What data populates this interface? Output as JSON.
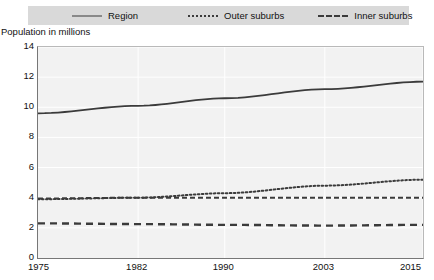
{
  "chart_data": {
    "type": "line",
    "title": "",
    "ylabel": "Population in millions",
    "xlabel": "",
    "ylim": [
      0,
      14
    ],
    "ytick_labels": [
      "0",
      "2",
      "4",
      "6",
      "8",
      "10",
      "12",
      "14"
    ],
    "ytick_values": [
      0,
      2,
      4,
      6,
      8,
      10,
      12,
      14
    ],
    "x": [
      1975,
      1982,
      1990,
      2003,
      2015
    ],
    "xtick_labels": [
      "1975",
      "1982",
      "1990",
      "2003",
      "2015"
    ],
    "grid": "horizontal-and-vertical-white",
    "legend_position": "top",
    "series": [
      {
        "name": "Region",
        "style": "solid",
        "color": "#3b3b3b",
        "values": [
          9.6,
          10.1,
          10.6,
          11.2,
          11.7
        ]
      },
      {
        "name": "Outer suburbs",
        "style": "dotted",
        "color": "#3b3b3b",
        "values": [
          3.9,
          4.0,
          4.3,
          4.8,
          5.2
        ]
      },
      {
        "name": "Inner suburbs",
        "style": "dash-dot",
        "color": "#3b3b3b",
        "values": [
          3.95,
          4.0,
          4.0,
          4.0,
          4.0
        ]
      },
      {
        "name": "Paris",
        "style": "dashed",
        "color": "#3b3b3b",
        "values": [
          2.3,
          2.25,
          2.2,
          2.15,
          2.2
        ]
      }
    ]
  },
  "legend": {
    "items": [
      {
        "label": "Region",
        "style": "solid"
      },
      {
        "label": "Outer suburbs",
        "style": "dotted"
      },
      {
        "label": "Inner suburbs",
        "style": "dash-dot"
      },
      {
        "label": "Paris",
        "style": "dashed"
      }
    ]
  },
  "colors": {
    "legend_background": "#d9d9d9",
    "plot_background": "#f2f2f2",
    "line": "#3b3b3b",
    "axis": "#777777",
    "gridline": "#ffffff",
    "text": "#111111"
  }
}
